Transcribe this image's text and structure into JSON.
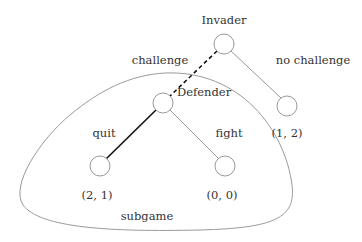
{
  "diagram": {
    "type": "game-tree",
    "colors": {
      "line": "#9a9a9a",
      "strong": "#111111",
      "text": "#333333",
      "background": "#ffffff"
    },
    "nodes": [
      {
        "id": "invader",
        "label": "Invader",
        "cx": 224,
        "cy": 44
      },
      {
        "id": "defender",
        "label": "Defender",
        "cx": 163,
        "cy": 103
      },
      {
        "id": "leaf-quit",
        "payoff": "(2, 1)",
        "cx": 100,
        "cy": 166
      },
      {
        "id": "leaf-fight",
        "payoff": "(0, 0)",
        "cx": 225,
        "cy": 166
      },
      {
        "id": "leaf-no-challenge",
        "payoff": "(1, 2)",
        "cx": 287,
        "cy": 106
      }
    ],
    "edges": [
      {
        "from": "invader",
        "to": "defender",
        "label": "challenge",
        "style": "dashed"
      },
      {
        "from": "invader",
        "to": "leaf-no-challenge",
        "label": "no challenge",
        "style": "thin"
      },
      {
        "from": "defender",
        "to": "leaf-quit",
        "label": "quit",
        "style": "bold"
      },
      {
        "from": "defender",
        "to": "leaf-fight",
        "label": "fight",
        "style": "thin"
      }
    ],
    "labels": {
      "invader": "Invader",
      "defender": "Defender",
      "challenge": "challenge",
      "no_challenge": "no challenge",
      "quit": "quit",
      "fight": "fight",
      "payoff_quit": "(2, 1)",
      "payoff_fight": "(0, 0)",
      "payoff_no_challenge": "(1, 2)",
      "subgame": "subgame"
    }
  }
}
